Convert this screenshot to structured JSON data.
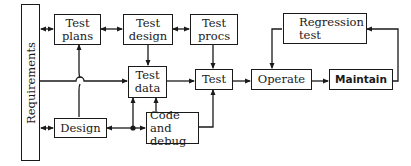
{
  "diagram": {
    "type": "flow",
    "nodes": {
      "requirements": "Requirements",
      "test_plans": "Test plans",
      "test_design": "Test design",
      "test_procs": "Test procs",
      "test_data": "Test data",
      "test": "Test",
      "operate": "Operate",
      "maintain": "Maintain",
      "regression_test": "Regression test",
      "design": "Design",
      "code_and_debug": "Code and debug"
    },
    "labels": {
      "test_plans_1": "Test",
      "test_plans_2": "plans",
      "test_design_1": "Test",
      "test_design_2": "design",
      "test_procs_1": "Test",
      "test_procs_2": "procs",
      "test_data_1": "Test",
      "test_data_2": "data",
      "code_1": "Code and",
      "code_2": "debug",
      "regression_1": "Regression",
      "regression_2": "test"
    },
    "edges": [
      {
        "from": "requirements",
        "to": "test_plans",
        "bidirectional": true
      },
      {
        "from": "test_plans",
        "to": "test_design",
        "bidirectional": true
      },
      {
        "from": "test_design",
        "to": "test_procs",
        "bidirectional": true
      },
      {
        "from": "test_design",
        "to": "test_data"
      },
      {
        "from": "requirements",
        "to": "test_data"
      },
      {
        "from": "design",
        "to": "test_plans"
      },
      {
        "from": "requirements",
        "to": "design",
        "bidirectional": true
      },
      {
        "from": "code_and_debug",
        "to": "design"
      },
      {
        "from": "design",
        "to": "code_and_debug"
      },
      {
        "from": "design",
        "to": "test_data"
      },
      {
        "from": "code_and_debug",
        "to": "test_data"
      },
      {
        "from": "test_data",
        "to": "test"
      },
      {
        "from": "test_procs",
        "to": "test"
      },
      {
        "from": "code_and_debug",
        "to": "test"
      },
      {
        "from": "test",
        "to": "operate"
      },
      {
        "from": "operate",
        "to": "maintain"
      },
      {
        "from": "maintain",
        "to": "regression_test"
      },
      {
        "from": "regression_test",
        "to": "operate"
      }
    ]
  }
}
